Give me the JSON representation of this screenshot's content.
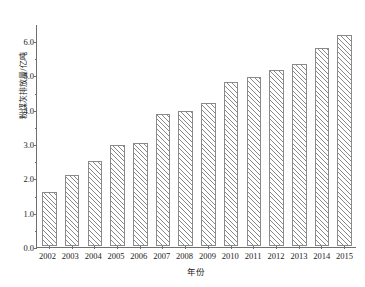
{
  "chart_data": {
    "type": "bar",
    "title": "",
    "xlabel": "年份",
    "ylabel": "粉煤灰排放量/亿吨",
    "categories": [
      "2002",
      "2003",
      "2004",
      "2005",
      "2006",
      "2007",
      "2008",
      "2009",
      "2010",
      "2011",
      "2012",
      "2013",
      "2014",
      "2015"
    ],
    "values": [
      1.6,
      2.08,
      2.5,
      2.98,
      3.03,
      3.88,
      3.96,
      4.21,
      4.82,
      4.97,
      5.19,
      5.34,
      5.81,
      6.2
    ],
    "ylim": [
      0.0,
      6.5
    ],
    "yticks": [
      "0.0",
      "1.0",
      "2.0",
      "3.0",
      "4.0",
      "5.0",
      "6.0"
    ],
    "ytick_values": [
      0.0,
      1.0,
      2.0,
      3.0,
      4.0,
      5.0,
      6.0
    ],
    "yminor_values": [
      0.5,
      1.5,
      2.5,
      3.5,
      4.5,
      5.5
    ],
    "grid": false,
    "legend": null,
    "series": [
      {
        "name": "粉煤灰排放量",
        "values": [
          1.6,
          2.08,
          2.5,
          2.98,
          3.03,
          3.88,
          3.96,
          4.21,
          4.82,
          4.97,
          5.19,
          5.34,
          5.81,
          6.2
        ]
      }
    ],
    "colors": {
      "bar_edge": "#8a8a8a",
      "bar_fill": "#ffffff",
      "hatch": "#828282",
      "axis": "#6f6f6f",
      "text": "#1c1c1c",
      "background": "#ffffff"
    },
    "hatch_pattern": "diagonal-forward-slash"
  }
}
